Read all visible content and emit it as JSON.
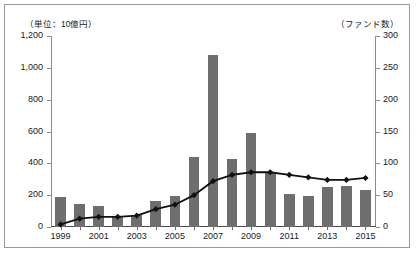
{
  "axis": {
    "left_unit_label": "（単位：10億円）",
    "right_unit_label": "（ファンド数）",
    "left_ticks": [
      "1,200",
      "1,000",
      "800",
      "600",
      "400",
      "200",
      "0"
    ],
    "right_ticks": [
      "300",
      "250",
      "200",
      "150",
      "100",
      "50",
      "0"
    ],
    "x_tick_labels": [
      "1999",
      "2001",
      "2003",
      "2005",
      "2007",
      "2009",
      "2011",
      "2013",
      "2015"
    ]
  },
  "chart_data": {
    "type": "bar",
    "title": "",
    "subtitle": "",
    "xlabel": "",
    "ylabel": "（単位：10億円）",
    "y2label": "（ファンド数）",
    "ylim": [
      0,
      1200
    ],
    "y2lim": [
      0,
      300
    ],
    "grid": false,
    "legend": "none",
    "categories": [
      "1999",
      "2000",
      "2001",
      "2002",
      "2003",
      "2004",
      "2005",
      "2006",
      "2007",
      "2008",
      "2009",
      "2010",
      "2011",
      "2012",
      "2013",
      "2014",
      "2015"
    ],
    "series": [
      {
        "name": "金額（10億円）",
        "type": "bar",
        "axis": "left",
        "color": "#6e6e6e",
        "values": [
          190,
          145,
          130,
          60,
          75,
          165,
          195,
          440,
          1080,
          425,
          590,
          345,
          205,
          195,
          250,
          255,
          235
        ]
      },
      {
        "name": "ファンド数",
        "type": "line",
        "axis": "right",
        "color": "#111111",
        "marker": "diamond",
        "values": [
          4,
          13,
          16,
          16,
          18,
          28,
          35,
          50,
          72,
          82,
          86,
          86,
          82,
          78,
          74,
          74,
          77
        ]
      }
    ]
  }
}
